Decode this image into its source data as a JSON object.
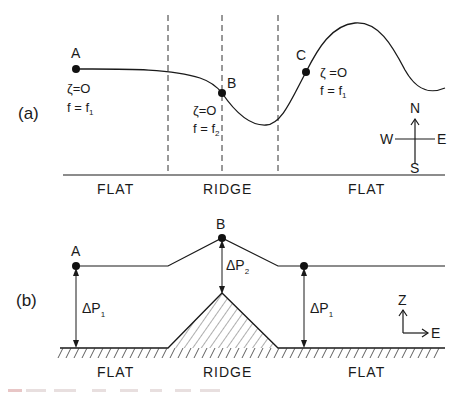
{
  "panel_a": {
    "label": "(a)",
    "points": [
      {
        "name": "A",
        "zeta": "ζ=O",
        "f": "f = f",
        "f_sub": "1"
      },
      {
        "name": "B",
        "zeta": "ζ=O",
        "f": "f = f",
        "f_sub": "2"
      },
      {
        "name": "C",
        "zeta": "ζ =O",
        "f": "f = f",
        "f_sub": "1"
      }
    ],
    "regions": [
      "FLAT",
      "RIDGE",
      "FLAT"
    ],
    "compass": {
      "n": "N",
      "s": "S",
      "e": "E",
      "w": "W"
    }
  },
  "panel_b": {
    "label": "(b)",
    "points": [
      {
        "name": "A"
      },
      {
        "name": "B"
      }
    ],
    "deltas": [
      {
        "symbol": "ΔP",
        "sub": "1"
      },
      {
        "symbol": "ΔP",
        "sub": "2"
      },
      {
        "symbol": "ΔP",
        "sub": "1"
      }
    ],
    "regions": [
      "FLAT",
      "RIDGE",
      "FLAT"
    ],
    "axes": {
      "z": "Z",
      "e": "E"
    }
  }
}
